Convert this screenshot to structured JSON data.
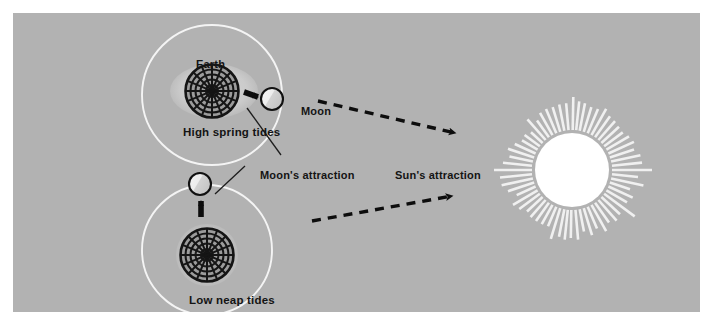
{
  "diagram": {
    "background_color": "#b2b2b2",
    "panel_border_color": "#ffffff",
    "labels": {
      "earth": "Earth",
      "high_spring_tides": "High spring tides",
      "moon": "Moon",
      "moons_attraction": "Moon's attraction",
      "suns_attraction": "Sun's attraction",
      "low_neap_tides": "Low neap tides"
    },
    "colors": {
      "panel": "#b2b2b2",
      "orbit_line": "#f2f2f2",
      "globe_outline": "#1a1a1a",
      "globe_fill": "#9a9a9a",
      "tidal_bulge": "#cfcfcf",
      "moon_fill": "#e8e8e8",
      "moon_outline": "#111111",
      "arrow": "#0d0d0d",
      "sun_fill": "#ffffff",
      "sun_rays": "#f0f0f0",
      "text": "#141414"
    },
    "elements": {
      "upper_system": {
        "name": "spring-tide-alignment",
        "orbit": {
          "cx": 212,
          "cy": 95,
          "r": 70
        },
        "earth": {
          "cx": 212,
          "cy": 91,
          "r": 27,
          "bulge_rx": 42,
          "bulge_ry": 27
        },
        "moon": {
          "cx": 272,
          "cy": 99,
          "r": 11
        },
        "arrow": {
          "x1": 245,
          "y1": 92,
          "x2": 262,
          "y2": 98
        }
      },
      "lower_system": {
        "name": "neap-tide-alignment",
        "orbit": {
          "cx": 207,
          "cy": 250,
          "r": 65
        },
        "earth": {
          "cx": 207,
          "cy": 255,
          "r": 27
        },
        "moon": {
          "cx": 200,
          "cy": 184,
          "r": 11
        },
        "arrow": {
          "x1": 201,
          "y1": 218,
          "x2": 201,
          "y2": 199
        }
      },
      "sun": {
        "name": "sun",
        "cx": 572,
        "cy": 170,
        "r": 36,
        "ray_count": 72,
        "ray_inner_radius": 40,
        "ray_outer_radius_min": 58,
        "ray_outer_radius_max": 82
      },
      "dashed_arrows": [
        {
          "name": "moon-to-sun-upper",
          "x1": 318,
          "y1": 101,
          "x2": 455,
          "y2": 133
        },
        {
          "name": "moon-to-sun-lower",
          "x1": 312,
          "y1": 221,
          "x2": 452,
          "y2": 196
        }
      ],
      "leader_lines": [
        {
          "name": "leader-moons-attraction-upper",
          "x1": 248,
          "y1": 110,
          "x2": 281,
          "y2": 154
        },
        {
          "name": "leader-moons-attraction-lower",
          "x1": 215,
          "y1": 194,
          "x2": 245,
          "y2": 166
        }
      ]
    }
  }
}
